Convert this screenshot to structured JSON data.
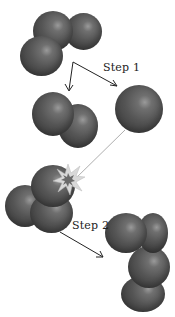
{
  "diagram": {
    "type": "molecular reaction diagram",
    "colors": {
      "atom": "#555555",
      "atom_highlight": "#9a9a9a",
      "arrow": "#222222",
      "trajectory_line": "#999999",
      "burst_outer": "#d8d8d8",
      "burst_inner": "#6a6a6a",
      "background": "#ffffff"
    },
    "labels": {
      "step1": "Step 1",
      "step2": "Step 2"
    },
    "groups": [
      {
        "id": "reactant-molecule",
        "atoms": 3,
        "position": "top-center"
      },
      {
        "id": "diatomic-product",
        "atoms": 2,
        "position": "middle-left"
      },
      {
        "id": "single-atom",
        "atoms": 1,
        "position": "middle-right"
      },
      {
        "id": "collision-molecule",
        "atoms": 3,
        "position": "lower-left",
        "effect": "starburst"
      },
      {
        "id": "final-product",
        "atoms": 4,
        "position": "bottom-right"
      }
    ],
    "arrows": [
      {
        "from": "reactant-molecule",
        "to": "diatomic-product",
        "label": "Step 1"
      },
      {
        "from": "reactant-molecule",
        "to": "single-atom",
        "label": "Step 1"
      },
      {
        "from": "collision-molecule",
        "to": "final-product",
        "label": "Step 2"
      }
    ]
  }
}
